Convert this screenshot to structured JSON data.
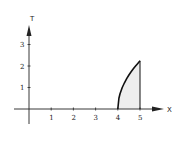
{
  "chart_data": {
    "type": "area",
    "title": "",
    "xlabel": "X",
    "ylabel": "T",
    "x_ticks": [
      1,
      2,
      3,
      4,
      5
    ],
    "y_ticks": [
      1,
      2,
      3
    ],
    "xlim": [
      -0.2,
      6.1
    ],
    "ylim": [
      -1.2,
      4.5
    ],
    "grid": false,
    "legend": null,
    "series": [
      {
        "name": "curve",
        "x": [
          4.0,
          4.05,
          4.1,
          4.2,
          4.3,
          4.4,
          4.5,
          4.6,
          4.7,
          4.8,
          4.9,
          5.0
        ],
        "values": [
          0.0,
          0.5,
          0.71,
          1.0,
          1.22,
          1.41,
          1.58,
          1.73,
          1.87,
          2.0,
          2.12,
          2.24
        ]
      }
    ],
    "shaded_region": {
      "x_from": 4.0,
      "x_to": 5.0,
      "fill": "#eeeeee"
    },
    "vertical_line": {
      "x": 5.0,
      "y_from": 0,
      "y_to": 2.24
    }
  },
  "colors": {
    "axis": "#222222",
    "curve": "#111111",
    "fill": "#eeeeee"
  }
}
